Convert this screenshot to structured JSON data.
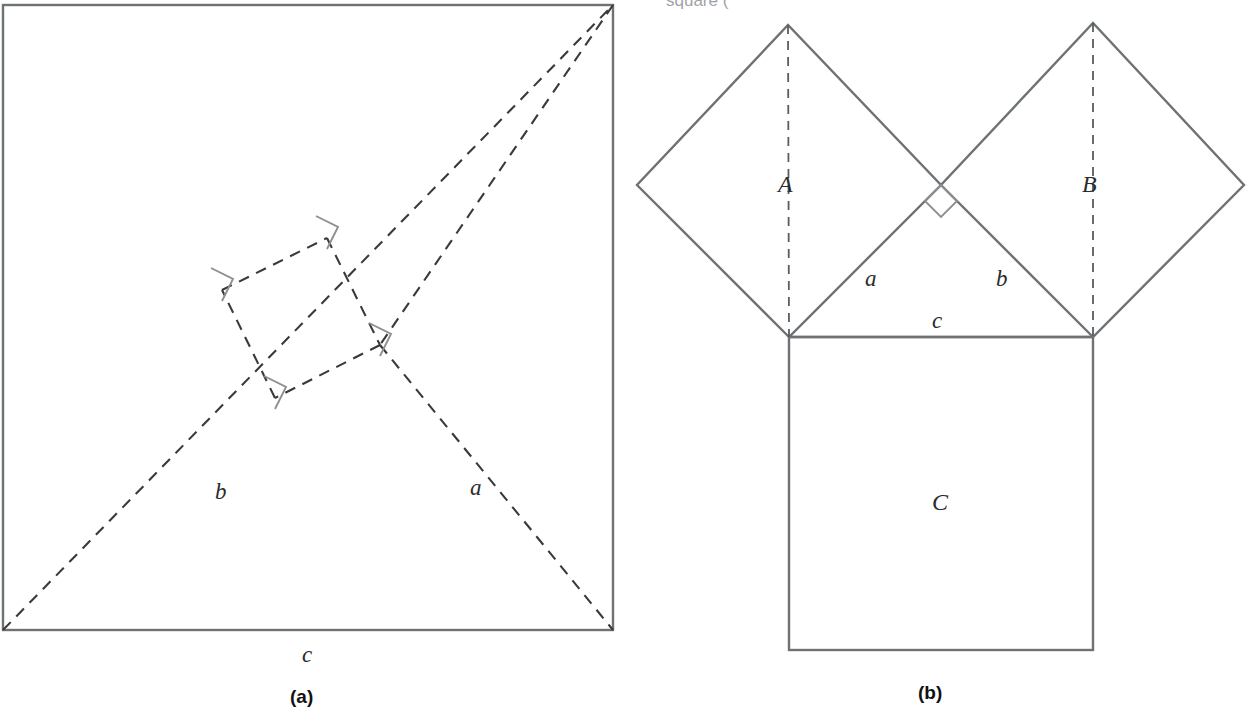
{
  "figure": {
    "title_fragment_top": "square (",
    "panels": [
      {
        "id": "panel-a",
        "caption": "(a)",
        "caption_x": 305,
        "caption_y": 703,
        "description": "Large square of side c with four congruent right triangles arranged around a tilted inner square",
        "outer_square": {
          "x": 3,
          "y": 5,
          "width": 610,
          "height": 625,
          "stroke": "#6e7275"
        },
        "labels": [
          {
            "text": "b",
            "x": 215,
            "y": 499,
            "style": "math"
          },
          {
            "text": "a",
            "x": 470,
            "y": 495,
            "style": "math"
          },
          {
            "text": "c",
            "x": 302,
            "y": 662,
            "style": "math"
          }
        ],
        "dashed_polyline_points": "3,630 613,5 222,290 275,398 380,345 327,238 3,630",
        "right_angle_marks": 4
      },
      {
        "id": "panel-b",
        "caption": "(b)",
        "caption_x": 932,
        "caption_y": 699,
        "description": "Right triangle with squares A and B on the legs and square C on the hypotenuse",
        "triangle": {
          "left_vertex": [
            789,
            337
          ],
          "right_vertex": [
            1093,
            337
          ],
          "apex": [
            941,
            185
          ]
        },
        "square_a": {
          "label": "A",
          "points": "789,337 637,185 788,25 941,185"
        },
        "square_b": {
          "label": "B",
          "points": "1093,337 941,185 1093,23 1244,185"
        },
        "square_c": {
          "label": "C",
          "x": 789,
          "y": 337,
          "width": 304,
          "height": 313
        },
        "altitudes": [
          {
            "from": [
              788,
              25
            ],
            "to": [
              789,
              337
            ]
          },
          {
            "from": [
              1093,
              23
            ],
            "to": [
              1093,
              337
            ]
          }
        ],
        "labels": [
          {
            "text": "A",
            "x": 778,
            "y": 192,
            "style": "math-cap"
          },
          {
            "text": "B",
            "x": 1082,
            "y": 192,
            "style": "math-cap"
          },
          {
            "text": "C",
            "x": 932,
            "y": 510,
            "style": "math-cap"
          },
          {
            "text": "a",
            "x": 865,
            "y": 286,
            "style": "math"
          },
          {
            "text": "b",
            "x": 996,
            "y": 286,
            "style": "math"
          },
          {
            "text": "c",
            "x": 932,
            "y": 328,
            "style": "math"
          }
        ],
        "right_angle_mark": {
          "at": [
            941,
            185
          ],
          "size": 22
        }
      }
    ],
    "colors": {
      "solid_line": "#6e7275",
      "dashed_line": "#3a3a3a",
      "angle_mark": "#8d9093",
      "text": "#2b2b2b",
      "caption": "#111111",
      "background": "#ffffff"
    }
  }
}
